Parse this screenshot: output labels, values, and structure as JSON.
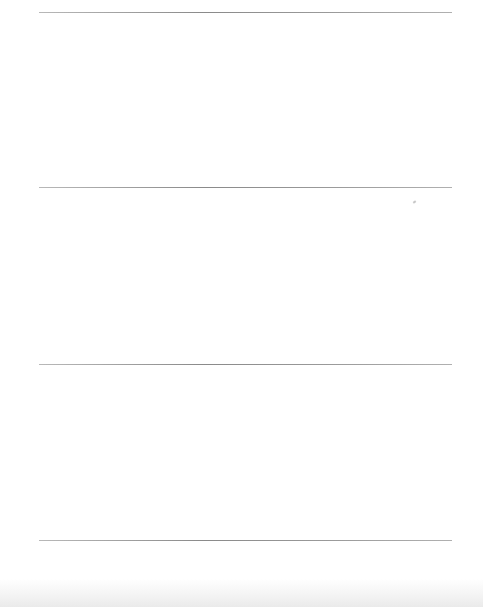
{
  "document": {
    "type": "blank ruled page",
    "rules": [
      {
        "y": 12
      },
      {
        "y": 187
      },
      {
        "y": 364
      },
      {
        "y": 540
      }
    ],
    "rule_color": "#8a8a8a",
    "background": "#ffffff"
  }
}
